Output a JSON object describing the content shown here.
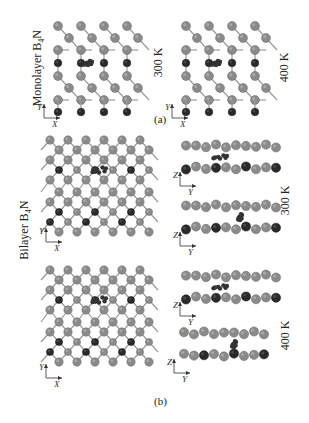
{
  "figure": {
    "panel_a": {
      "caption": "(a)",
      "row_label": "Monolayer B₄N",
      "row_label_main": "Monolayer B",
      "row_label_sub": "4",
      "row_label_tail": "N",
      "structures": [
        {
          "temperature": "300 K",
          "view": "top",
          "axes": [
            "X",
            "Y"
          ]
        },
        {
          "temperature": "400 K",
          "view": "top",
          "axes": [
            "X",
            "Y"
          ]
        }
      ]
    },
    "panel_b": {
      "caption": "(b)",
      "row_label_main": "Bilayer B",
      "row_label_sub": "4",
      "row_label_tail": "N",
      "structures": [
        {
          "temperature": "300 K",
          "view": "top",
          "axes": [
            "X",
            "Y"
          ]
        },
        {
          "temperature": "300 K",
          "view": "side",
          "axes": [
            "Y",
            "Z"
          ]
        },
        {
          "temperature": "300 K",
          "view": "side",
          "axes": [
            "Y",
            "Z"
          ]
        },
        {
          "temperature": "400 K",
          "view": "top",
          "axes": [
            "X",
            "Y"
          ]
        },
        {
          "temperature": "400 K",
          "view": "side",
          "axes": [
            "Y",
            "Z"
          ]
        },
        {
          "temperature": "400 K",
          "view": "side",
          "axes": [
            "Y",
            "Z"
          ]
        }
      ],
      "temperature_labels": [
        "300 K",
        "400 K"
      ]
    },
    "colors": {
      "boron_atom": "#8a8a8a",
      "nitrogen_atom": "#2a2a2a",
      "adsorbate": "#333333",
      "bond": "#9a9a9a"
    }
  }
}
